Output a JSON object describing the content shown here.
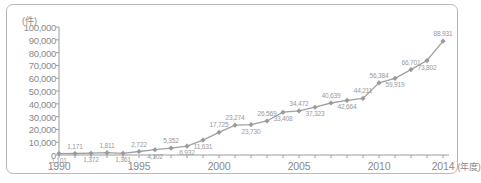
{
  "chart_data": {
    "type": "line",
    "title": "",
    "unit_label": "(件)",
    "xlabel": "(年度)",
    "ylabel": "",
    "ylim": [
      0,
      100000
    ],
    "ytick_step": 10000,
    "ytick_labels": [
      "100,000",
      "90,000",
      "80,000",
      "70,000",
      "60,000",
      "50,000",
      "40,000",
      "30,000",
      "20,000",
      "10,000",
      "0"
    ],
    "xtick_labels": [
      "1990",
      "1995",
      "2000",
      "2005",
      "2010",
      "2014"
    ],
    "xlim": [
      1990,
      2014
    ],
    "grid": false,
    "legend": "none",
    "series_color": "#a0a0a0",
    "marker": "diamond",
    "categories": [
      1990,
      1991,
      1992,
      1993,
      1994,
      1995,
      1996,
      1997,
      1998,
      1999,
      2000,
      2001,
      2002,
      2003,
      2004,
      2005,
      2006,
      2007,
      2008,
      2009,
      2010,
      2011,
      2012,
      2013,
      2014
    ],
    "values": [
      1101,
      1171,
      1372,
      1811,
      1361,
      2722,
      4102,
      5352,
      6932,
      11631,
      17725,
      23274,
      23730,
      26569,
      33408,
      34472,
      37323,
      40639,
      42664,
      44211,
      56384,
      59919,
      66701,
      73802,
      88931
    ],
    "point_labels": [
      "1,101",
      "1,171",
      "1,372",
      "1,811",
      "1,361",
      "2,722",
      "4,102",
      "5,352",
      "6,932",
      "11,631",
      "17,725",
      "23,274",
      "23,730",
      "26,569",
      "33,408",
      "34,472",
      "37,323",
      "40,639",
      "42,664",
      "44,211",
      "56,384",
      "59,919",
      "66,701",
      "73,802",
      "88,931"
    ],
    "label_placement": [
      "below",
      "above",
      "below",
      "above",
      "below",
      "above",
      "below",
      "above",
      "below",
      "below",
      "above",
      "above",
      "below",
      "above",
      "below",
      "above",
      "below",
      "above",
      "below",
      "above",
      "above",
      "below",
      "above",
      "below",
      "above"
    ]
  },
  "colors": {
    "line": "#a0a0a0",
    "marker": "#9a9a9a",
    "axis": "#9a9a9a",
    "text": "#8a8a8a",
    "border": "#b9b9b9",
    "background": "#ffffff"
  }
}
